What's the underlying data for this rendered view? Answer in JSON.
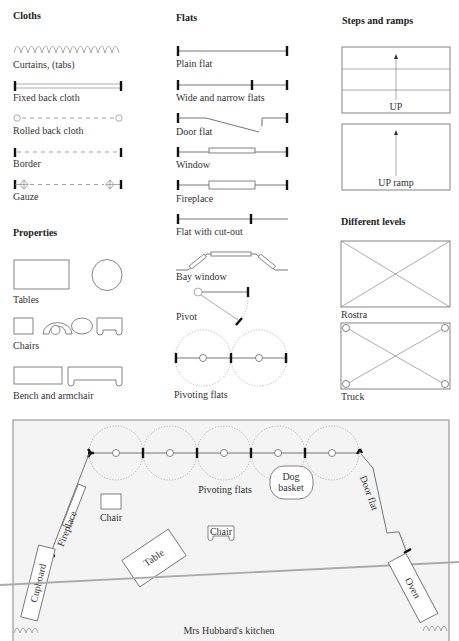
{
  "sections": {
    "cloths": {
      "heading": "Cloths",
      "items": [
        "Curtains, (tabs)",
        "Fixed back cloth",
        "Rolled back cloth",
        "Border",
        "Gauze"
      ]
    },
    "flats": {
      "heading": "Flats",
      "items": [
        "Plain flat",
        "Wide and narrow flats",
        "Door flat",
        "Window",
        "Fireplace",
        "Flat with cut-out",
        "Bay window",
        "Pivot",
        "Pivoting flats"
      ]
    },
    "steps": {
      "heading": "Steps and ramps",
      "items": [
        "UP",
        "UP ramp"
      ]
    },
    "properties": {
      "heading": "Properties",
      "items": [
        "Tables",
        "Chairs",
        "Bench and armchair"
      ]
    },
    "levels": {
      "heading": "Different levels",
      "items": [
        "Rostra",
        "Truck"
      ]
    }
  },
  "plan": {
    "title": "Mrs Hubbard's kitchen",
    "labels": {
      "pivoting_flats": "Pivoting flats",
      "dog_basket_1": "Dog",
      "dog_basket_2": "basket",
      "chair_1": "Chair",
      "chair_2": "Chair",
      "table": "Table",
      "fireplace": "Fireplace",
      "cupboard": "Cupboard",
      "door_flat": "Door flat",
      "oven": "Oven"
    },
    "background": "#f4f4f4",
    "border": "#888888"
  }
}
